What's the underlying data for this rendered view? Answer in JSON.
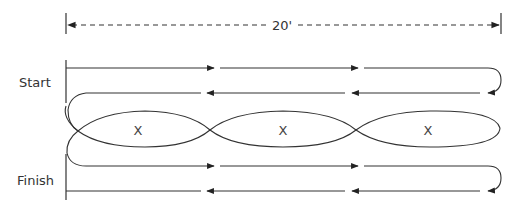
{
  "diagram": {
    "dimension_label": "20'",
    "start_label": "Start",
    "finish_label": "Finish",
    "markers": [
      "X",
      "X",
      "X"
    ],
    "colors": {
      "stroke": "#333333",
      "text": "#333333",
      "background": "#ffffff"
    }
  }
}
